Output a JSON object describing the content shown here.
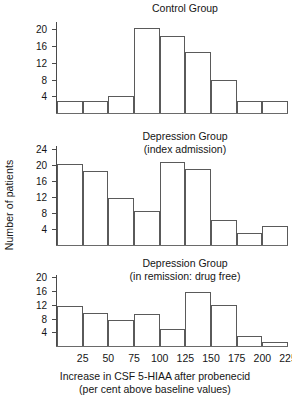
{
  "figure": {
    "y_axis_label": "Number of patients",
    "x_axis_caption": "Increase in CSF 5-HIAA after probenecid\n(per cent above baseline values)",
    "x_tick_labels": [
      "25",
      "50",
      "75",
      "100",
      "125",
      "150",
      "175",
      "200",
      "225"
    ],
    "line_color": "#5a5a5a",
    "text_color": "#151515",
    "background": "#ffffff"
  },
  "chart_data": [
    {
      "type": "bar",
      "title": "Control Group",
      "xlabel": "Increase in CSF 5-HIAA after probenecid (per cent above baseline values)",
      "ylabel": "Number of patients",
      "bin_edges": [
        0,
        25,
        50,
        75,
        100,
        125,
        150,
        175,
        200,
        225
      ],
      "categories": [
        "0-25",
        "25-50",
        "50-75",
        "75-100",
        "100-125",
        "125-150",
        "150-175",
        "175-200",
        "200-225"
      ],
      "values": [
        3,
        3,
        4,
        20.5,
        18.7,
        14.8,
        8,
        2.8,
        2.8
      ],
      "ylim": [
        0,
        22
      ],
      "yticks": [
        4,
        8,
        12,
        16,
        20
      ],
      "ytick_labels": [
        "4",
        "8",
        "12",
        "16",
        "20"
      ],
      "grid": false,
      "legend": "none"
    },
    {
      "type": "bar",
      "title": "Depression Group\n(index admission)",
      "xlabel": "Increase in CSF 5-HIAA after probenecid (per cent above baseline values)",
      "ylabel": "Number of patients",
      "bin_edges": [
        0,
        25,
        50,
        75,
        100,
        125,
        150,
        175,
        200,
        225
      ],
      "categories": [
        "0-25",
        "25-50",
        "50-75",
        "75-100",
        "100-125",
        "125-150",
        "150-175",
        "175-200",
        "200-225"
      ],
      "values": [
        20.5,
        18.6,
        11.8,
        8.7,
        21,
        19.3,
        6.2,
        3,
        4.8
      ],
      "ylim": [
        0,
        25
      ],
      "yticks": [
        4,
        8,
        12,
        16,
        20,
        24
      ],
      "ytick_labels": [
        "4",
        "8",
        "12",
        "16",
        "20",
        "24"
      ],
      "grid": false,
      "legend": "none"
    },
    {
      "type": "bar",
      "title": "Depression Group\n(in remission: drug free)",
      "xlabel": "Increase in CSF 5-HIAA after probenecid (per cent above baseline values)",
      "ylabel": "Number of patients",
      "bin_edges": [
        0,
        25,
        50,
        75,
        100,
        125,
        150,
        175,
        200,
        225
      ],
      "categories": [
        "0-25",
        "25-50",
        "50-75",
        "75-100",
        "100-125",
        "125-150",
        "150-175",
        "175-200",
        "200-225"
      ],
      "values": [
        11.8,
        9.7,
        7.7,
        9.4,
        5,
        16,
        12,
        3,
        1.3
      ],
      "ylim": [
        0,
        21
      ],
      "yticks": [
        4,
        8,
        12,
        16,
        20
      ],
      "ytick_labels": [
        "4",
        "8",
        "12",
        "16",
        "20"
      ],
      "grid": false,
      "legend": "none"
    }
  ]
}
